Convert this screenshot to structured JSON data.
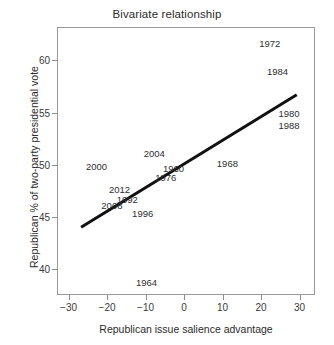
{
  "chart_data": {
    "type": "scatter",
    "title": "Bivariate relationship",
    "xlabel": "Republican issue salience advantage",
    "ylabel": "Republican % of two-party presidential vote",
    "xlim": [
      -33,
      34
    ],
    "ylim": [
      37.5,
      63.2
    ],
    "xticks": [
      -30,
      -20,
      -10,
      0,
      10,
      20,
      30
    ],
    "xtick_labels": [
      "−30",
      "−20",
      "−10",
      "0",
      "10",
      "20",
      "30"
    ],
    "yticks": [
      40,
      45,
      50,
      55,
      60
    ],
    "ytick_labels": [
      "40",
      "45",
      "50",
      "55",
      "60"
    ],
    "grid": false,
    "legend": false,
    "marker_style": "text-label",
    "points": [
      {
        "label": "1960",
        "x": -3,
        "y": 49.8
      },
      {
        "label": "1964",
        "x": -10,
        "y": 38.8
      },
      {
        "label": "1968",
        "x": 11,
        "y": 50.3
      },
      {
        "label": "1972",
        "x": 22,
        "y": 61.8
      },
      {
        "label": "1976",
        "x": -5,
        "y": 48.9
      },
      {
        "label": "1980",
        "x": 27,
        "y": 55.1
      },
      {
        "label": "1984",
        "x": 24,
        "y": 59.1
      },
      {
        "label": "1988",
        "x": 27,
        "y": 53.9
      },
      {
        "label": "1992",
        "x": -15,
        "y": 46.8
      },
      {
        "label": "1996",
        "x": -11,
        "y": 45.5
      },
      {
        "label": "2000",
        "x": -23,
        "y": 50.0
      },
      {
        "label": "2004",
        "x": -8,
        "y": 51.2
      },
      {
        "label": "2008",
        "x": -19,
        "y": 46.2
      },
      {
        "label": "2012",
        "x": -17,
        "y": 47.8
      }
    ],
    "fit_line": {
      "name": "regression-line",
      "x_start": -27,
      "y_start": 44.1,
      "x_end": 29,
      "y_end": 56.8,
      "color": "#111111",
      "width": 3
    }
  },
  "colors": {
    "panel_border": "#9a9a9a",
    "text": "#2b2b2b",
    "line": "#111111"
  }
}
